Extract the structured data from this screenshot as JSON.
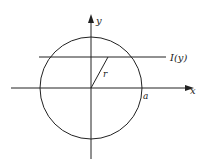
{
  "diagram": {
    "axes": {
      "x_label": "x",
      "y_label": "y"
    },
    "labels": {
      "chord_label": "I(y)",
      "radius_label": "r",
      "intercept_label": "a"
    },
    "colors": {
      "stroke": "#222222",
      "background": "#ffffff"
    }
  }
}
